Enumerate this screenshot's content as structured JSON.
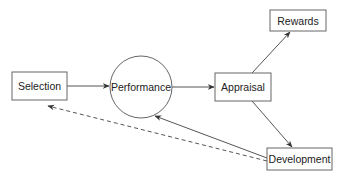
{
  "diagram": {
    "nodes": {
      "selection": {
        "label": "Selection",
        "shape": "rectangle"
      },
      "performance": {
        "label": "Performance",
        "shape": "circle"
      },
      "appraisal": {
        "label": "Appraisal",
        "shape": "rectangle"
      },
      "rewards": {
        "label": "Rewards",
        "shape": "rectangle"
      },
      "development": {
        "label": "Development",
        "shape": "rectangle"
      }
    },
    "edges": [
      {
        "from": "Selection",
        "to": "Performance",
        "style": "solid"
      },
      {
        "from": "Performance",
        "to": "Appraisal",
        "style": "solid"
      },
      {
        "from": "Appraisal",
        "to": "Rewards",
        "style": "solid"
      },
      {
        "from": "Appraisal",
        "to": "Development",
        "style": "solid"
      },
      {
        "from": "Development",
        "to": "Performance",
        "style": "solid"
      },
      {
        "from": "Development",
        "to": "Selection",
        "style": "dashed"
      }
    ],
    "colors": {
      "stroke": "#555555",
      "arrow": "#333333",
      "text": "#222222"
    }
  }
}
